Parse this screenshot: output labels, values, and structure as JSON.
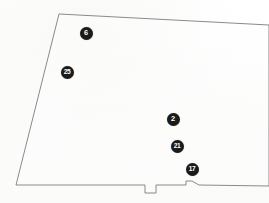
{
  "map": {
    "title": "Parcel boundary sketch",
    "background_color": "#fdfdfc",
    "line_color": "#7d7d7d",
    "marker_fill": "#1b1b1b",
    "marker_text_color": "#ffffff",
    "boundary": {
      "name": "parcel-outline",
      "description": "Quadrilateral parcel with slanted left edge, notched bottom edge, open right side",
      "path": "M 59 14 L 269 25 L 269 186 L 199 185 L 192 181 L 186 181 L 186 185 L 156 185 L 156 193 L 145 193 L 145 185 L 16 185 Z"
    },
    "markers": [
      {
        "id": "marker-6",
        "label": "6",
        "x": 86,
        "y": 33,
        "size": 13
      },
      {
        "id": "marker-25",
        "label": "25",
        "x": 67,
        "y": 72,
        "size": 13
      },
      {
        "id": "marker-2",
        "label": "2",
        "x": 173,
        "y": 119,
        "size": 13
      },
      {
        "id": "marker-21",
        "label": "21",
        "x": 177,
        "y": 146,
        "size": 13
      },
      {
        "id": "marker-17",
        "label": "17",
        "x": 192,
        "y": 169,
        "size": 13
      }
    ]
  }
}
